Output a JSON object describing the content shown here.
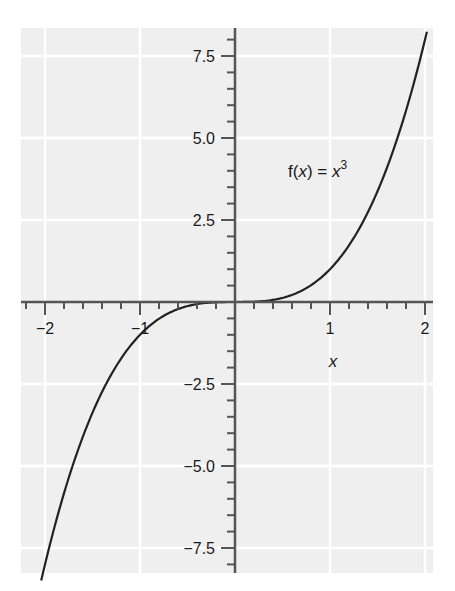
{
  "chart_data": {
    "type": "line",
    "title": "",
    "xlabel": "x",
    "ylabel": "",
    "xlim": [
      -2.2,
      2.1
    ],
    "ylim": [
      -8.6,
      8.2
    ],
    "grid": true,
    "legend": null,
    "x_ticks": [
      -2,
      -1,
      0,
      1,
      2
    ],
    "x_tick_labels": [
      "−2",
      "−1",
      "",
      "1",
      "2"
    ],
    "x_minor_step": 0.2,
    "y_ticks": [
      -7.5,
      -5.0,
      -2.5,
      0,
      2.5,
      5.0,
      7.5
    ],
    "y_tick_labels": [
      "−7.5",
      "−5.0",
      "−2.5",
      "",
      "2.5",
      "5.0",
      "7.5"
    ],
    "y_minor_step": 0.5,
    "series": [
      {
        "name": "f(x) = x^3",
        "function": "x^3",
        "x": [
          -2.04,
          -2.0,
          -1.8,
          -1.6,
          -1.4,
          -1.2,
          -1.0,
          -0.8,
          -0.6,
          -0.4,
          -0.2,
          0,
          0.2,
          0.4,
          0.6,
          0.8,
          1.0,
          1.2,
          1.4,
          1.6,
          1.8,
          2.0,
          2.02
        ],
        "values": [
          -8.49,
          -8.0,
          -5.832,
          -4.096,
          -2.744,
          -1.728,
          -1.0,
          -0.512,
          -0.216,
          -0.064,
          -0.008,
          0,
          0.008,
          0.064,
          0.216,
          0.512,
          1.0,
          1.728,
          2.744,
          4.096,
          5.832,
          8.0,
          8.24
        ]
      }
    ],
    "annotations": [
      {
        "text_main": "f(",
        "text_var": "x",
        "text_mid": ") = ",
        "text_var2": "x",
        "text_sup": "3",
        "x": 0.45,
        "y": 4.0
      }
    ]
  },
  "labels": {
    "x_axis_title": "x",
    "annotation": {
      "f_open": "f(",
      "var1": "x",
      "close_eq": ") = ",
      "var2": "x",
      "exp": "3"
    }
  }
}
